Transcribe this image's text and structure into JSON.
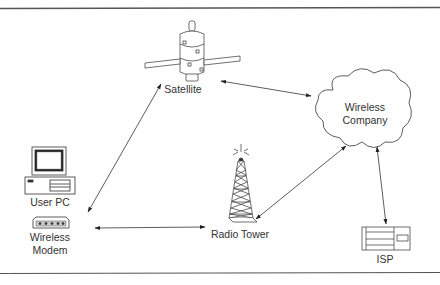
{
  "diagram": {
    "type": "network-topology",
    "nodes": {
      "satellite": {
        "label": "Satellite",
        "icon": "satellite-icon"
      },
      "wireless_company": {
        "label_line1": "Wireless",
        "label_line2": "Company",
        "icon": "cloud-icon"
      },
      "user_pc": {
        "label": "User PC",
        "icon": "desktop-computer-icon"
      },
      "wireless_modem": {
        "label_line1": "Wireless",
        "label_line2": "Modem",
        "icon": "modem-icon"
      },
      "radio_tower": {
        "label": "Radio Tower",
        "icon": "radio-tower-icon"
      },
      "isp": {
        "label": "ISP",
        "icon": "server-icon"
      }
    },
    "edges": [
      {
        "from": "Wireless Modem",
        "to": "Satellite",
        "direction": "bidirectional"
      },
      {
        "from": "Satellite",
        "to": "Wireless Company",
        "direction": "bidirectional"
      },
      {
        "from": "Wireless Modem",
        "to": "Radio Tower",
        "direction": "bidirectional"
      },
      {
        "from": "Radio Tower",
        "to": "Wireless Company",
        "direction": "bidirectional"
      },
      {
        "from": "Wireless Company",
        "to": "ISP",
        "direction": "bidirectional"
      }
    ],
    "colors": {
      "stroke": "#333333",
      "background": "#ffffff",
      "border": "#555555"
    }
  }
}
